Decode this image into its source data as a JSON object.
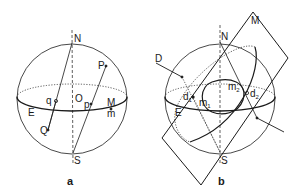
{
  "figure_a": {
    "caption": "a",
    "labels": {
      "north": "N",
      "south": "S",
      "center": "O",
      "pole_P": "P",
      "pole_Q": "Q",
      "proj_p": "p",
      "proj_q": "q",
      "point_M": "M",
      "point_m": "m",
      "equator": "E"
    }
  },
  "figure_b": {
    "caption": "b",
    "labels": {
      "north": "N",
      "south": "S",
      "plane": "M",
      "line": "D",
      "equator": "E",
      "d1": "d",
      "d1_sub": "1",
      "d2": "d",
      "d2_sub": "2",
      "m1": "m",
      "m1_sub": "1",
      "m2": "m",
      "m2_sub": "2"
    }
  },
  "colors": {
    "stroke": "#1a1a1a",
    "background": "#ffffff"
  }
}
